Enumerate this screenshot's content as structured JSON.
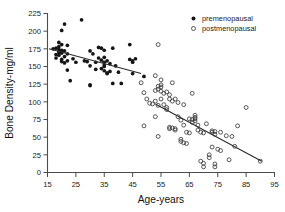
{
  "chart_data": {
    "type": "scatter",
    "title": "",
    "xlabel": "Age-years",
    "ylabel": "Bone Density-mg/ml",
    "xlim": [
      15,
      95
    ],
    "ylim": [
      0,
      225
    ],
    "xticks": [
      15,
      25,
      35,
      45,
      55,
      65,
      75,
      85,
      95
    ],
    "yticks": [
      0,
      25,
      50,
      75,
      100,
      125,
      150,
      175,
      200,
      225
    ],
    "grid": false,
    "legend_position": "top-right",
    "legend": [
      {
        "label": "premenopausal",
        "marker": "filled-circle",
        "color": "#151515"
      },
      {
        "label": "postmenopausal",
        "marker": "open-circle",
        "color": "#3b3b3b"
      }
    ],
    "series": [
      {
        "name": "premenopausal",
        "marker": "filled-circle",
        "points": [
          [
            17,
            175
          ],
          [
            18,
            176
          ],
          [
            18,
            167
          ],
          [
            18,
            162
          ],
          [
            19,
            184
          ],
          [
            19,
            178
          ],
          [
            19,
            174
          ],
          [
            19,
            170
          ],
          [
            19,
            166
          ],
          [
            20,
            201
          ],
          [
            20,
            181
          ],
          [
            20,
            173
          ],
          [
            20,
            169
          ],
          [
            20,
            160
          ],
          [
            20,
            157
          ],
          [
            21,
            210
          ],
          [
            21,
            172
          ],
          [
            21,
            164
          ],
          [
            21,
            155
          ],
          [
            22,
            180
          ],
          [
            22,
            168
          ],
          [
            22,
            158
          ],
          [
            22,
            145
          ],
          [
            23,
            130
          ],
          [
            24,
            161
          ],
          [
            25,
            156
          ],
          [
            27,
            216
          ],
          [
            28,
            158
          ],
          [
            29,
            157
          ],
          [
            30,
            172
          ],
          [
            30,
            151
          ],
          [
            30,
            124
          ],
          [
            30,
            123
          ],
          [
            31,
            168
          ],
          [
            32,
            156
          ],
          [
            32,
            146
          ],
          [
            33,
            177
          ],
          [
            33,
            162
          ],
          [
            34,
            176
          ],
          [
            34,
            159
          ],
          [
            34,
            147
          ],
          [
            35,
            173
          ],
          [
            35,
            163
          ],
          [
            35,
            156
          ],
          [
            35,
            152
          ],
          [
            35,
            150
          ],
          [
            35,
            144
          ],
          [
            36,
            158
          ],
          [
            36,
            141
          ],
          [
            36,
            140
          ],
          [
            37,
            154
          ],
          [
            37,
            143
          ],
          [
            38,
            176
          ],
          [
            38,
            126
          ],
          [
            39,
            151
          ],
          [
            40,
            142
          ],
          [
            41,
            126
          ],
          [
            44,
            181
          ],
          [
            44,
            160
          ],
          [
            45,
            158
          ],
          [
            45,
            156
          ],
          [
            45,
            140
          ],
          [
            46,
            161
          ],
          [
            49,
            136
          ]
        ]
      },
      {
        "name": "postmenopausal",
        "marker": "open-circle",
        "points": [
          [
            48,
            127
          ],
          [
            49,
            113
          ],
          [
            49,
            66
          ],
          [
            50,
            104
          ],
          [
            51,
            98
          ],
          [
            52,
            97
          ],
          [
            53,
            137
          ],
          [
            53,
            116
          ],
          [
            53,
            101
          ],
          [
            53,
            79
          ],
          [
            54,
            181
          ],
          [
            54,
            122
          ],
          [
            54,
            118
          ],
          [
            54,
            95
          ],
          [
            54,
            51
          ],
          [
            55,
            131
          ],
          [
            55,
            124
          ],
          [
            55,
            121
          ],
          [
            55,
            115
          ],
          [
            55,
            104
          ],
          [
            56,
            112
          ],
          [
            56,
            96
          ],
          [
            57,
            114
          ],
          [
            57,
            92
          ],
          [
            57,
            89
          ],
          [
            58,
            110
          ],
          [
            58,
            104
          ],
          [
            58,
            64
          ],
          [
            58,
            62
          ],
          [
            59,
            127
          ],
          [
            59,
            101
          ],
          [
            59,
            63
          ],
          [
            60,
            104
          ],
          [
            60,
            62
          ],
          [
            60,
            60
          ],
          [
            61,
            99
          ],
          [
            61,
            79
          ],
          [
            62,
            74
          ],
          [
            62,
            47
          ],
          [
            62,
            44
          ],
          [
            63,
            96
          ],
          [
            63,
            67
          ],
          [
            63,
            42
          ],
          [
            64,
            57
          ],
          [
            64,
            41
          ],
          [
            65,
            76
          ],
          [
            65,
            56
          ],
          [
            66,
            112
          ],
          [
            66,
            75
          ],
          [
            66,
            71
          ],
          [
            67,
            81
          ],
          [
            67,
            78
          ],
          [
            67,
            76
          ],
          [
            67,
            73
          ],
          [
            68,
            67
          ],
          [
            68,
            60
          ],
          [
            69,
            57
          ],
          [
            69,
            16
          ],
          [
            70,
            56
          ],
          [
            70,
            13
          ],
          [
            70,
            8
          ],
          [
            71,
            69
          ],
          [
            72,
            25
          ],
          [
            72,
            21
          ],
          [
            73,
            59
          ],
          [
            73,
            57
          ],
          [
            73,
            36
          ],
          [
            74,
            58
          ],
          [
            74,
            54
          ],
          [
            74,
            12
          ],
          [
            74,
            8
          ],
          [
            75,
            33
          ],
          [
            76,
            57
          ],
          [
            76,
            31
          ],
          [
            78,
            52
          ],
          [
            79,
            18
          ],
          [
            80,
            51
          ],
          [
            81,
            37
          ],
          [
            82,
            66
          ],
          [
            85,
            92
          ],
          [
            90,
            16
          ]
        ]
      }
    ],
    "fit_lines": [
      {
        "name": "premenopausal-regression",
        "x0": 15.5,
        "y0": 175,
        "x1": 48.0,
        "y1": 140
      },
      {
        "name": "postmenopausal-regression",
        "x0": 53.0,
        "y0": 97,
        "x1": 90.5,
        "y1": 16
      }
    ]
  }
}
